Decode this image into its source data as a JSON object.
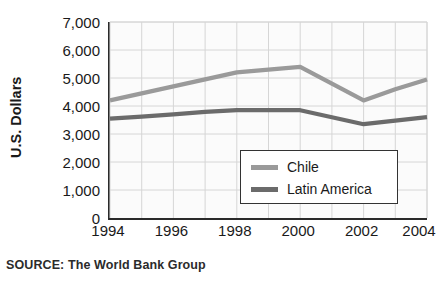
{
  "chart_data": {
    "type": "line",
    "title": "",
    "subtitle": "",
    "xlabel": "",
    "ylabel": "U.S. Dollars",
    "x": [
      1994,
      1995,
      1996,
      1997,
      1998,
      1999,
      2000,
      2001,
      2002,
      2003,
      2004
    ],
    "xtick_labels": [
      "1994",
      "1996",
      "1998",
      "2000",
      "2002",
      "2004"
    ],
    "xtick_values": [
      1994,
      1996,
      1998,
      2000,
      2002,
      2004
    ],
    "xlim": [
      1994,
      2004
    ],
    "ytick_labels": [
      "0",
      "1,000",
      "2,000",
      "3,000",
      "4,000",
      "5,000",
      "6,000",
      "7,000"
    ],
    "ytick_values": [
      0,
      1000,
      2000,
      3000,
      4000,
      5000,
      6000,
      7000
    ],
    "ylim": [
      0,
      7000
    ],
    "grid": true,
    "legend_position": "inside-lower-right",
    "series": [
      {
        "name": "Chile",
        "color": "#9a9a9a",
        "values": [
          4200,
          4450,
          4700,
          4950,
          5200,
          5300,
          5400,
          4800,
          4200,
          4600,
          4950
        ]
      },
      {
        "name": "Latin America",
        "color": "#6b6b6b",
        "values": [
          3550,
          3620,
          3700,
          3790,
          3850,
          3850,
          3850,
          3600,
          3350,
          3480,
          3600
        ]
      }
    ]
  },
  "legend": {
    "items": [
      {
        "label": "Chile",
        "color": "#9a9a9a"
      },
      {
        "label": "Latin America",
        "color": "#6b6b6b"
      }
    ]
  },
  "source": {
    "text": "SOURCE: The World Bank Group"
  },
  "colors": {
    "chile": "#9a9a9a",
    "latin_america": "#6b6b6b",
    "axis": "#2a2a2a",
    "grid": "#d6d6d6",
    "plot_background": "#fbfbfb"
  }
}
